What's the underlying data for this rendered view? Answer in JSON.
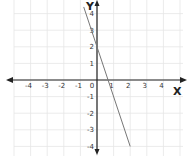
{
  "chart_data": {
    "type": "line",
    "title": "",
    "xlabel": "X",
    "ylabel": "Y",
    "xlim": [
      -5,
      5
    ],
    "ylim": [
      -4.6,
      4.6
    ],
    "grid": true,
    "x_ticks": [
      -4,
      -3,
      -2,
      -1,
      0,
      1,
      2,
      3,
      4
    ],
    "x_tick_labels": [
      "-4",
      "-3",
      "-2",
      "-1",
      "0",
      "1",
      "2",
      "3",
      "4"
    ],
    "y_ticks": [
      4,
      3,
      2,
      1,
      -1,
      -2,
      -3,
      -4
    ],
    "y_tick_labels": [
      "4",
      "3",
      "2",
      "1",
      "-1",
      "-2",
      "-3",
      "-4"
    ],
    "series": [
      {
        "name": "y = -3x + 2",
        "slope": -3,
        "intercept": 2,
        "x": [
          -0.8,
          2
        ],
        "y": [
          4.4,
          -4
        ],
        "color": "#777777"
      }
    ],
    "colors": {
      "axis": "#222222",
      "grid": "#e6e6e6"
    }
  }
}
